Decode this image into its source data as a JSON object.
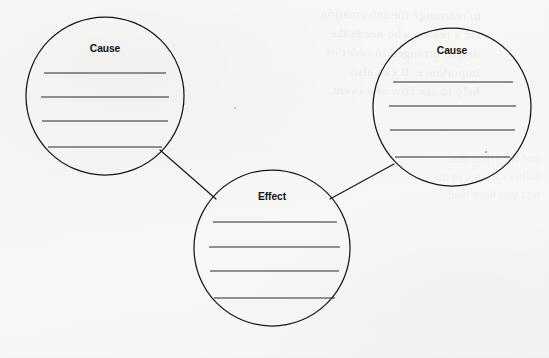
{
  "document": {
    "kind": "graphic-organizer-worksheet",
    "title": "Cause and Effect Graphic Organizer",
    "background_color": "#f8f8f7",
    "ink_color": "#15161a",
    "line_color": "#2a2b2f"
  },
  "diagram": {
    "type": "cause-and-effect-cluster",
    "nodes": [
      {
        "id": "cause-left",
        "label": "Cause",
        "cx": 105,
        "cy": 96,
        "r": 79,
        "label_y": 52,
        "lines": [
          {
            "y": 73,
            "x1": 44,
            "x2": 166
          },
          {
            "y": 97,
            "x1": 41,
            "x2": 169
          },
          {
            "y": 121,
            "x1": 42,
            "x2": 168
          },
          {
            "y": 147,
            "x1": 48,
            "x2": 162
          }
        ]
      },
      {
        "id": "cause-right",
        "label": "Cause",
        "cx": 452,
        "cy": 107,
        "r": 79,
        "label_y": 54,
        "lines": [
          {
            "y": 82,
            "x1": 393,
            "x2": 513
          },
          {
            "y": 106,
            "x1": 389,
            "x2": 516
          },
          {
            "y": 130,
            "x1": 390,
            "x2": 515
          },
          {
            "y": 157,
            "x1": 395,
            "x2": 510
          }
        ]
      },
      {
        "id": "effect-center",
        "label": "Effect",
        "cx": 272,
        "cy": 248,
        "r": 78,
        "label_y": 200,
        "lines": [
          {
            "y": 222,
            "x1": 213,
            "x2": 337
          },
          {
            "y": 247,
            "x1": 209,
            "x2": 340
          },
          {
            "y": 271,
            "x1": 210,
            "x2": 339
          },
          {
            "y": 298,
            "x1": 214,
            "x2": 335
          }
        ]
      }
    ],
    "connectors": [
      {
        "id": "cause-left-to-effect",
        "x1": 160,
        "y1": 150,
        "x2": 216,
        "y2": 199
      },
      {
        "id": "cause-right-to-effect",
        "x1": 330,
        "y1": 199,
        "x2": 394,
        "y2": 164
      }
    ],
    "specks": [
      {
        "x": 486,
        "y": 152,
        "r": 1.0
      },
      {
        "x": 235,
        "y": 108,
        "r": 0.7
      }
    ]
  },
  "bleed_through": {
    "note": "mirrored show-through text from reverse page; illegible",
    "lines": [
      "to rearrange the information",
      "for a reader who needs the",
      "details arranged in order of",
      "importance. It can also",
      "help to see how one event"
    ],
    "lines_2": [
      "and the effect that",
      "follows from it in the",
      "text you have read"
    ]
  }
}
